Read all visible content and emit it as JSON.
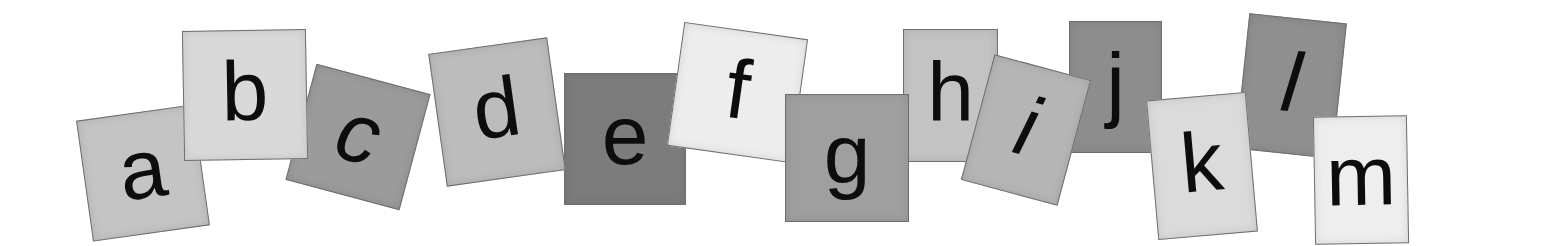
{
  "image": {
    "description": "Row of lowercase alphabet letters a through m printed on tilted grayscale watercolor paper squares",
    "background": "#ffffff"
  },
  "tiles": [
    {
      "letter": "a",
      "x": 84,
      "y": 112,
      "w": 118,
      "h": 122,
      "rot": -8,
      "fill": "#c4c4c4",
      "italic": false,
      "z": 1
    },
    {
      "letter": "b",
      "x": 183,
      "y": 30,
      "w": 124,
      "h": 130,
      "rot": -1,
      "fill": "#d9d9d9",
      "italic": false,
      "z": 2
    },
    {
      "letter": "c",
      "x": 299,
      "y": 77,
      "w": 118,
      "h": 120,
      "rot": 15,
      "fill": "#9b9b9b",
      "italic": true,
      "z": 1
    },
    {
      "letter": "d",
      "x": 437,
      "y": 45,
      "w": 120,
      "h": 134,
      "rot": -8,
      "fill": "#bcbcbc",
      "italic": false,
      "z": 2
    },
    {
      "letter": "e",
      "x": 564,
      "y": 73,
      "w": 122,
      "h": 132,
      "rot": 0,
      "fill": "#7c7c7c",
      "italic": false,
      "z": 1
    },
    {
      "letter": "f",
      "x": 675,
      "y": 30,
      "w": 125,
      "h": 125,
      "rot": 8,
      "fill": "#ededed",
      "italic": false,
      "z": 2
    },
    {
      "letter": "g",
      "x": 785,
      "y": 94,
      "w": 124,
      "h": 128,
      "rot": 0,
      "fill": "#9f9f9f",
      "italic": false,
      "z": 3
    },
    {
      "letter": "h",
      "x": 903,
      "y": 29,
      "w": 95,
      "h": 133,
      "rot": 0,
      "fill": "#c3c3c3",
      "italic": false,
      "z": 1
    },
    {
      "letter": "i",
      "x": 976,
      "y": 65,
      "w": 100,
      "h": 130,
      "rot": 15,
      "fill": "#b5b5b5",
      "italic": true,
      "z": 2
    },
    {
      "letter": "j",
      "x": 1069,
      "y": 21,
      "w": 93,
      "h": 132,
      "rot": 0,
      "fill": "#8d8d8d",
      "italic": false,
      "z": 1
    },
    {
      "letter": "k",
      "x": 1152,
      "y": 96,
      "w": 100,
      "h": 140,
      "rot": -5,
      "fill": "#dbdbdb",
      "italic": false,
      "z": 3
    },
    {
      "letter": "l",
      "x": 1242,
      "y": 18,
      "w": 98,
      "h": 136,
      "rot": 6,
      "fill": "#8f8f8f",
      "italic": true,
      "z": 2
    },
    {
      "letter": "m",
      "x": 1314,
      "y": 116,
      "w": 94,
      "h": 128,
      "rot": -1,
      "fill": "#eeeeee",
      "italic": false,
      "z": 4
    }
  ]
}
